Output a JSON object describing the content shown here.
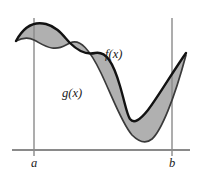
{
  "figure": {
    "kind": "area-between-curves-diagram",
    "background_color": "#ffffff",
    "labels": {
      "f_label": "f(x)",
      "g_label": "g(x)",
      "left_bound_label": "a",
      "right_bound_label": "b"
    },
    "colors": {
      "curve_f_stroke": "#121212",
      "curve_g_stroke": "#3a3a3a",
      "region_fill": "#b0b0b0",
      "axis_stroke": "#8a8a8a",
      "text": "#1a1a1a"
    },
    "axis": {
      "baseline_y": 150,
      "baseline_x_start": 12,
      "baseline_x_end": 190,
      "left_bound_x": 34,
      "right_bound_x": 172,
      "vertical_top_y": 18,
      "vertical_bottom_y": 156
    },
    "label_positions": {
      "f_label_x": 105,
      "f_label_y": 58,
      "g_label_x": 62,
      "g_label_y": 97,
      "a_label_x": 34,
      "a_label_y": 167,
      "b_label_x": 172,
      "b_label_y": 167
    },
    "curve_f_path": "M 16,41 C 24,26 34,21 46,24 C 58,27 64,37 70,43 C 78,51 86,55 95,53 C 106,51 113,62 120,86 C 125,103 127,115 130,119 C 134,124 140,120 148,110 C 158,97 172,73 186,53",
    "curve_g_path": "M 16,41 C 22,38 28,37 34,40 C 40,43 45,47 52,48 C 60,49 64,46 70,43 C 80,38 90,50 101,73 C 112,96 122,124 132,135 C 139,142 146,144 152,139 C 161,131 174,100 186,55",
    "region_path": "M 16,41 C 24,26 34,21 46,24 C 58,27 64,37 70,43 C 78,51 86,55 95,53 C 106,51 113,62 120,86 C 125,103 127,115 130,119 C 134,124 140,120 148,110 C 158,97 172,73 186,53 L 186,55 C 174,100 161,131 152,139 C 146,144 139,142 132,135 C 122,124 112,96 101,73 C 90,50 80,38 70,43 C 64,46 60,49 52,48 C 45,47 40,43 34,40 C 28,37 22,38 16,41 Z"
  }
}
